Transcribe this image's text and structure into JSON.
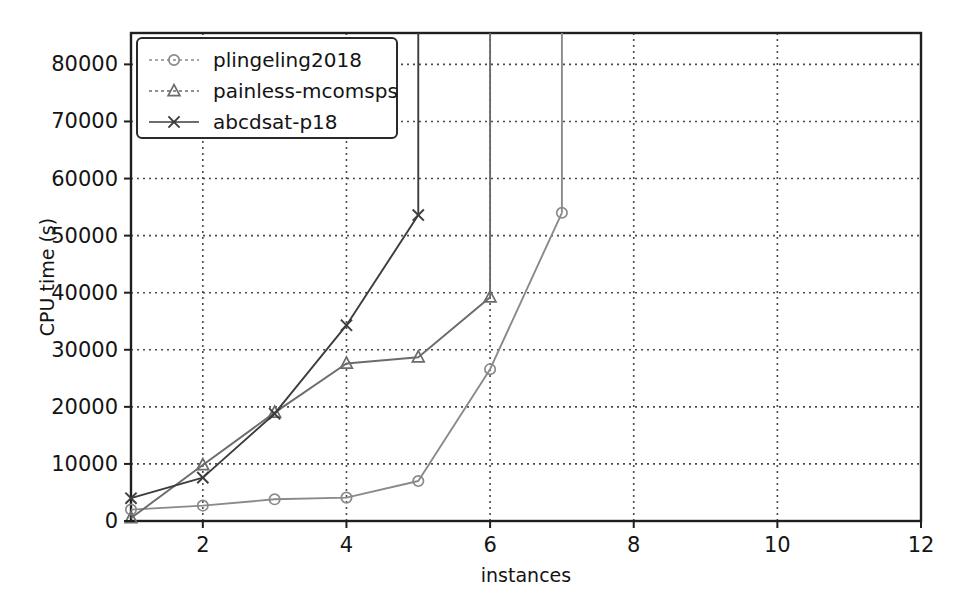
{
  "chart_data": {
    "type": "line",
    "title": "",
    "xlabel": "instances",
    "ylabel": "CPU time (s)",
    "xlim": [
      1,
      12
    ],
    "ylim": [
      0,
      85500
    ],
    "xticks": [
      2,
      4,
      6,
      8,
      10,
      12
    ],
    "yticks": [
      0,
      10000,
      20000,
      30000,
      40000,
      50000,
      60000,
      70000,
      80000
    ],
    "xticklabels": [
      "2",
      "4",
      "6",
      "8",
      "10",
      "12"
    ],
    "yticklabels": [
      "0",
      "10000",
      "20000",
      "30000",
      "40000",
      "50000",
      "60000",
      "70000",
      "80000"
    ],
    "grid": true,
    "grid_style": "dotted",
    "legend_position": "upper left",
    "series": [
      {
        "name": "plingeling2018",
        "marker": "circle",
        "color": "#8a8a8a",
        "x": [
          1,
          2,
          3,
          4,
          5,
          6,
          7
        ],
        "y": [
          2000,
          2700,
          3800,
          4100,
          7000,
          26600,
          54000
        ],
        "cutoff_x": 7,
        "cutoff_top": 85500
      },
      {
        "name": "painless-mcomsps",
        "marker": "triangle",
        "color": "#6b6b6b",
        "x": [
          1,
          2,
          3,
          4,
          5,
          6
        ],
        "y": [
          500,
          9800,
          19000,
          27600,
          28700,
          39200
        ],
        "cutoff_x": 6,
        "cutoff_top": 85500
      },
      {
        "name": "abcdsat-p18",
        "marker": "x",
        "color": "#3c3c3c",
        "x": [
          1,
          2,
          3,
          4,
          5
        ],
        "y": [
          4000,
          7600,
          18800,
          34300,
          53600
        ],
        "cutoff_x": 5,
        "cutoff_top": 85500
      }
    ]
  }
}
